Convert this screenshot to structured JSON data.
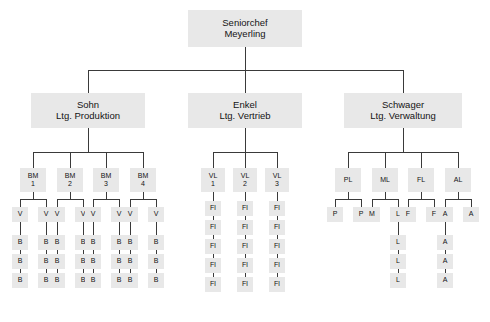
{
  "diagram": {
    "box_fill": "#e8e8e8",
    "line_color": "#3a3a3a",
    "text_color": "#141414"
  },
  "caption": {
    "text": ""
  },
  "nodes": {
    "root": {
      "line1": "Seniorchef",
      "line2": "Meyerling"
    },
    "div1": {
      "line1": "Sohn",
      "line2": "Ltg. Produktion"
    },
    "div2": {
      "line1": "Enkel",
      "line2": "Ltg. Vertrieb"
    },
    "div3": {
      "line1": "Schwager",
      "line2": "Ltg. Verwaltung"
    },
    "bm": [
      {
        "line1": "BM",
        "line2": "1"
      },
      {
        "line1": "BM",
        "line2": "2"
      },
      {
        "line1": "BM",
        "line2": "3"
      },
      {
        "line1": "BM",
        "line2": "4"
      }
    ],
    "vl": [
      {
        "line1": "VL",
        "line2": "1"
      },
      {
        "line1": "VL",
        "line2": "2"
      },
      {
        "line1": "VL",
        "line2": "3"
      }
    ],
    "adm": [
      {
        "line1": "PL"
      },
      {
        "line1": "ML"
      },
      {
        "line1": "FL"
      },
      {
        "line1": "AL"
      }
    ],
    "v_label": "V",
    "b_label": "B",
    "fl_label": "Fl",
    "p_label": "P",
    "m_label": "M",
    "l_label": "L",
    "f_label": "F",
    "a_label": "A"
  },
  "structure": {
    "production": {
      "foremen_count": 4,
      "workers_per_foreman": 2,
      "operators_per_worker": 3
    },
    "sales": {
      "leads_count": 3,
      "reps_per_lead": 5
    },
    "administration": {
      "units": [
        {
          "head": "PL",
          "members": [
            "P",
            "P"
          ],
          "chain_under_second": []
        },
        {
          "head": "ML",
          "members": [
            "M",
            "L"
          ],
          "chain_under_second": [
            "L",
            "L",
            "L"
          ]
        },
        {
          "head": "FL",
          "members": [
            "F",
            "F"
          ],
          "chain_under_second": []
        },
        {
          "head": "AL",
          "members": [
            "A",
            "A"
          ],
          "chain_under_first": [
            "A",
            "A",
            "A"
          ]
        }
      ]
    }
  }
}
